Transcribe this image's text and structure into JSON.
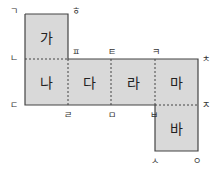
{
  "faces": {
    "ga": "가",
    "na": "나",
    "da": "다",
    "ra": "라",
    "ma": "마",
    "ba": "바"
  },
  "vertices": {
    "g": "ㄱ",
    "h": "ㅎ",
    "n": "ㄴ",
    "p": "ㅍ",
    "t": "ㅌ",
    "k": "ㅋ",
    "ch": "ㅊ",
    "d": "ㄷ",
    "r": "ㄹ",
    "m": "ㅁ",
    "b": "ㅂ",
    "j": "ㅈ",
    "s": "ㅅ",
    "o": "ㅇ"
  },
  "colors": {
    "face_fill": "#d9d9d9",
    "line": "#444444"
  }
}
